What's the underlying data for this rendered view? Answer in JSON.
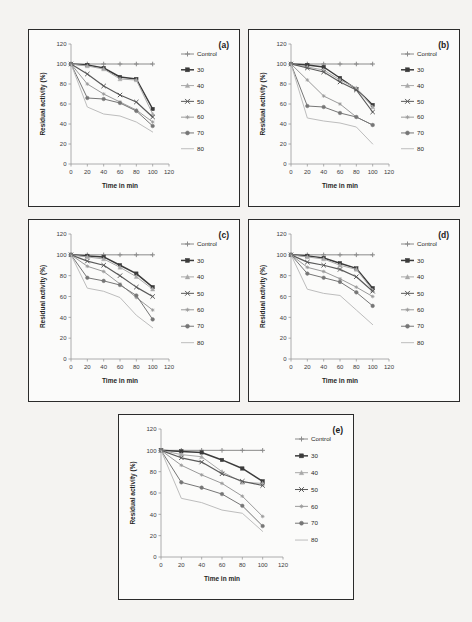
{
  "figure": {
    "background_color": "#f4f3f1",
    "panel_background": "#fbfbfa",
    "panel_border_color": "#2b2b2b"
  },
  "common": {
    "xlabel": "Time in min",
    "ylabel": "Residual activity (%)",
    "xticks": [
      "0",
      "20",
      "40",
      "60",
      "80",
      "100",
      "120"
    ],
    "yticks": [
      "0",
      "20",
      "40",
      "60",
      "80",
      "100",
      "120"
    ],
    "xlim": [
      0,
      120
    ],
    "ylim": [
      0,
      120
    ],
    "x_values": [
      0,
      20,
      40,
      60,
      80,
      100
    ],
    "legend_entries": [
      "Control",
      "30",
      "40",
      "50",
      "60",
      "70",
      "80"
    ],
    "series_colors": {
      "Control": "#8a8a8a",
      "30": "#3b3b3b",
      "40": "#a9a9a9",
      "50": "#5a5a5a",
      "60": "#9a9a9a",
      "70": "#767676",
      "80": "#bdbdbd"
    },
    "series_markers": {
      "Control": "plus",
      "30": "square",
      "40": "triangle",
      "50": "cross",
      "60": "star",
      "70": "circle",
      "80": "none"
    }
  },
  "chart_data": [
    {
      "type": "line",
      "panel_label": "(a)",
      "title": "",
      "xlabel": "Time in min",
      "ylabel": "Residual activity (%)",
      "xlim": [
        0,
        120
      ],
      "ylim": [
        0,
        120
      ],
      "grid": false,
      "legend_position": "right",
      "x": [
        0,
        20,
        40,
        60,
        80,
        100
      ],
      "series": [
        {
          "name": "Control",
          "values": [
            100,
            100,
            100,
            100,
            100,
            100
          ]
        },
        {
          "name": "30",
          "values": [
            100,
            99,
            96,
            87,
            85,
            55
          ]
        },
        {
          "name": "40",
          "values": [
            100,
            98,
            95,
            85,
            84,
            50
          ]
        },
        {
          "name": "50",
          "values": [
            100,
            90,
            78,
            69,
            62,
            47
          ]
        },
        {
          "name": "60",
          "values": [
            100,
            80,
            70,
            62,
            54,
            42
          ]
        },
        {
          "name": "70",
          "values": [
            100,
            66,
            65,
            61,
            53,
            38
          ]
        },
        {
          "name": "80",
          "values": [
            100,
            57,
            50,
            48,
            42,
            32
          ]
        }
      ]
    },
    {
      "type": "line",
      "panel_label": "(b)",
      "title": "",
      "xlabel": "Time in min",
      "ylabel": "Residual activity (%)",
      "xlim": [
        0,
        120
      ],
      "ylim": [
        0,
        120
      ],
      "grid": false,
      "legend_position": "right",
      "x": [
        0,
        20,
        40,
        60,
        80,
        100
      ],
      "series": [
        {
          "name": "Control",
          "values": [
            100,
            100,
            100,
            100,
            100,
            100
          ]
        },
        {
          "name": "30",
          "values": [
            100,
            99,
            97,
            86,
            75,
            59
          ]
        },
        {
          "name": "40",
          "values": [
            100,
            97,
            94,
            84,
            76,
            57
          ]
        },
        {
          "name": "50",
          "values": [
            100,
            96,
            92,
            82,
            74,
            52
          ]
        },
        {
          "name": "60",
          "values": [
            100,
            84,
            68,
            60,
            47,
            39
          ]
        },
        {
          "name": "70",
          "values": [
            100,
            58,
            57,
            51,
            47,
            39
          ]
        },
        {
          "name": "80",
          "values": [
            100,
            46,
            43,
            41,
            37,
            20
          ]
        }
      ]
    },
    {
      "type": "line",
      "panel_label": "(c)",
      "title": "",
      "xlabel": "Time in min",
      "ylabel": "Residual activity (%)",
      "xlim": [
        0,
        120
      ],
      "ylim": [
        0,
        120
      ],
      "grid": false,
      "legend_position": "right",
      "x": [
        0,
        20,
        40,
        60,
        80,
        100
      ],
      "series": [
        {
          "name": "Control",
          "values": [
            100,
            100,
            100,
            100,
            100,
            100
          ]
        },
        {
          "name": "30",
          "values": [
            100,
            99,
            98,
            90,
            82,
            69
          ]
        },
        {
          "name": "40",
          "values": [
            100,
            98,
            96,
            88,
            79,
            67
          ]
        },
        {
          "name": "50",
          "values": [
            100,
            94,
            90,
            80,
            69,
            60
          ]
        },
        {
          "name": "60",
          "values": [
            100,
            89,
            84,
            72,
            59,
            47
          ]
        },
        {
          "name": "70",
          "values": [
            100,
            78,
            75,
            71,
            61,
            38
          ]
        },
        {
          "name": "80",
          "values": [
            100,
            68,
            65,
            59,
            42,
            30
          ]
        }
      ]
    },
    {
      "type": "line",
      "panel_label": "(d)",
      "title": "",
      "xlabel": "Time in min",
      "ylabel": "Residual activity (%)",
      "xlim": [
        0,
        120
      ],
      "ylim": [
        0,
        120
      ],
      "grid": false,
      "legend_position": "right",
      "x": [
        0,
        20,
        40,
        60,
        80,
        100
      ],
      "series": [
        {
          "name": "Control",
          "values": [
            100,
            100,
            100,
            100,
            100,
            100
          ]
        },
        {
          "name": "30",
          "values": [
            100,
            99,
            97,
            92,
            87,
            68
          ]
        },
        {
          "name": "40",
          "values": [
            100,
            98,
            96,
            90,
            86,
            66
          ]
        },
        {
          "name": "50",
          "values": [
            100,
            93,
            90,
            86,
            79,
            65
          ]
        },
        {
          "name": "60",
          "values": [
            100,
            88,
            84,
            77,
            69,
            60
          ]
        },
        {
          "name": "70",
          "values": [
            100,
            82,
            78,
            74,
            64,
            51
          ]
        },
        {
          "name": "80",
          "values": [
            100,
            67,
            63,
            61,
            47,
            33
          ]
        }
      ]
    },
    {
      "type": "line",
      "panel_label": "(e)",
      "title": "",
      "xlabel": "Time in min",
      "ylabel": "Residual activity (%)",
      "xlim": [
        0,
        120
      ],
      "ylim": [
        0,
        120
      ],
      "grid": false,
      "legend_position": "right",
      "x": [
        0,
        20,
        40,
        60,
        80,
        100
      ],
      "series": [
        {
          "name": "Control",
          "values": [
            100,
            100,
            100,
            100,
            100,
            100
          ]
        },
        {
          "name": "30",
          "values": [
            100,
            99,
            98,
            91,
            83,
            71
          ]
        },
        {
          "name": "40",
          "values": [
            100,
            96,
            94,
            80,
            70,
            69
          ]
        },
        {
          "name": "50",
          "values": [
            100,
            93,
            89,
            78,
            71,
            67
          ]
        },
        {
          "name": "60",
          "values": [
            100,
            86,
            77,
            69,
            57,
            38
          ]
        },
        {
          "name": "70",
          "values": [
            100,
            70,
            65,
            59,
            48,
            29
          ]
        },
        {
          "name": "80",
          "values": [
            100,
            55,
            51,
            44,
            41,
            24
          ]
        }
      ]
    }
  ],
  "panels": [
    {
      "label": "(a)",
      "x": 28,
      "y": 29,
      "w": 212,
      "h": 178
    },
    {
      "label": "(b)",
      "x": 248,
      "y": 29,
      "w": 212,
      "h": 178
    },
    {
      "label": "(c)",
      "x": 28,
      "y": 219,
      "w": 212,
      "h": 183
    },
    {
      "label": "(d)",
      "x": 248,
      "y": 219,
      "w": 212,
      "h": 183
    },
    {
      "label": "(e)",
      "x": 118,
      "y": 414,
      "w": 236,
      "h": 186
    }
  ]
}
